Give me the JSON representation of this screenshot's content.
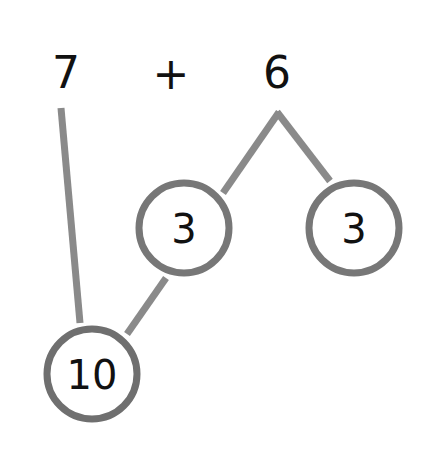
{
  "equation": {
    "left_operand": "7",
    "operator": "+",
    "right_operand": "6"
  },
  "bonds": {
    "split_left": "3",
    "split_right": "3",
    "make_ten": "10"
  },
  "colors": {
    "line": "#8a8a8a",
    "circle_stroke": "#777777",
    "text": "#111111",
    "background": "#ffffff"
  }
}
